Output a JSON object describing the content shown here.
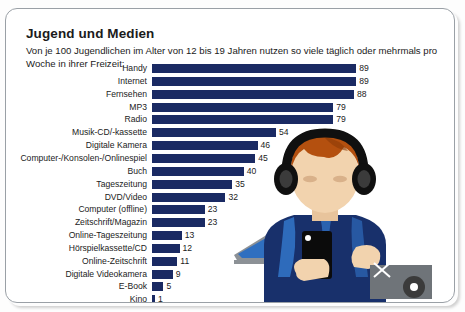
{
  "card": {
    "title": "Jugend und Medien",
    "subtitle": "Von je 100 Jugendlichen im Alter von 12 bis 19 Jahren nutzen so viele täglich oder mehrmals pro Woche in ihrer Freizeit:"
  },
  "colors": {
    "bar": "#1a2a63",
    "text": "#1b1b1b",
    "card_border": "#9aa0a6",
    "background": "#ffffff",
    "illustration_hoodie": "#18306b",
    "illustration_hoodie_light": "#2f6fc0",
    "illustration_hair": "#b4500f",
    "illustration_skin": "#f2d3ae",
    "illustration_headphones": "#101010",
    "illustration_screen": "#2f6fc0",
    "illustration_device_frame": "#8c9196"
  },
  "chart_data": {
    "type": "bar",
    "orientation": "horizontal",
    "title": "Jugend und Medien",
    "subtitle": "Von je 100 Jugendlichen im Alter von 12 bis 19 Jahren nutzen so viele täglich oder mehrmals pro Woche in ihrer Freizeit:",
    "xlabel": "",
    "ylabel": "",
    "xlim": [
      0,
      100
    ],
    "grid": false,
    "legend": false,
    "value_labels": true,
    "categories": [
      "Handy",
      "Internet",
      "Fernsehen",
      "MP3",
      "Radio",
      "Musik-CD/-kassette",
      "Digitale Kamera",
      "Computer-/Konsolen-/Onlinespiel",
      "Buch",
      "Tageszeitung",
      "DVD/Video",
      "Computer (offline)",
      "Zeitschrift/Magazin",
      "Online-Tageszeitung",
      "Hörspielkassette/CD",
      "Online-Zeitschrift",
      "Digitale Videokamera",
      "E-Book",
      "Kino"
    ],
    "values": [
      89,
      89,
      88,
      79,
      79,
      54,
      46,
      45,
      40,
      35,
      32,
      23,
      23,
      13,
      12,
      11,
      9,
      5,
      1
    ]
  }
}
